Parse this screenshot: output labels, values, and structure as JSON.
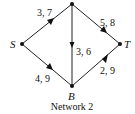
{
  "diagram": {
    "caption": "Network 2",
    "nodes": {
      "top": {
        "label": "",
        "x": 72,
        "y": 4
      },
      "S": {
        "label": "S",
        "x": 22,
        "y": 44
      },
      "T": {
        "label": "T",
        "x": 120,
        "y": 44
      },
      "B": {
        "label": "B",
        "x": 72,
        "y": 86
      }
    },
    "edges": [
      {
        "from": "S",
        "to": "top",
        "label": "3, 7"
      },
      {
        "from": "top",
        "to": "T",
        "label": "5, 8"
      },
      {
        "from": "top",
        "to": "B",
        "label": "3, 6"
      },
      {
        "from": "S",
        "to": "B",
        "label": "4, 9"
      },
      {
        "from": "B",
        "to": "T",
        "label": "2, 9"
      }
    ],
    "colors": {
      "line": "#222222",
      "node": "#111111",
      "background": "#ffffff"
    }
  }
}
